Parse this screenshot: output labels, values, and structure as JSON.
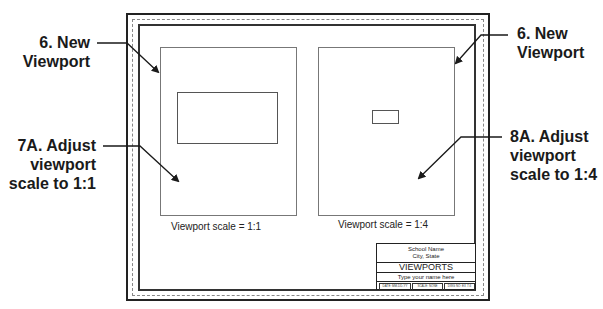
{
  "callouts": {
    "top_left": {
      "line1": "6.  New",
      "line2": "Viewport"
    },
    "mid_left": {
      "line1": "7A. Adjust",
      "line2": "viewport",
      "line3": "scale to 1:1"
    },
    "top_right": {
      "line1": "6.  New",
      "line2": "Viewport"
    },
    "mid_right": {
      "line1": "8A. Adjust",
      "line2": "viewport",
      "line3": "scale to 1:4"
    }
  },
  "viewports": [
    {
      "caption": "Viewport scale = 1:1",
      "scale": "1:1"
    },
    {
      "caption": "Viewport scale = 1:4",
      "scale": "1:4"
    }
  ],
  "title_block": {
    "school": "School Name",
    "city": "City, State",
    "title": "VIEWPORTS",
    "name": "Type your name here",
    "cells": [
      "DATE: MM-DD-YY",
      "SCALE: NONE",
      "DWG NO: EX 7-6"
    ]
  },
  "colors": {
    "line": "#222222",
    "viewport": "#777777",
    "dashed": "#888888"
  }
}
